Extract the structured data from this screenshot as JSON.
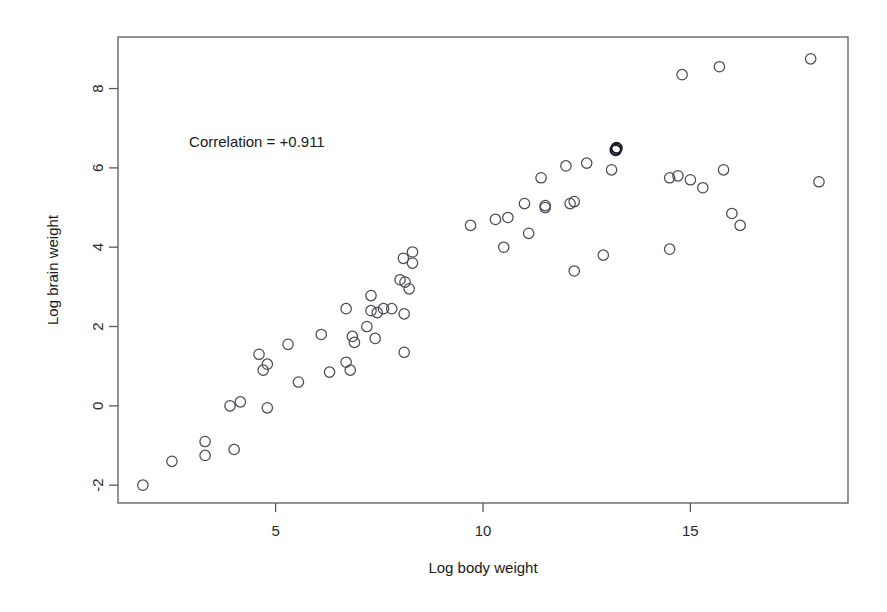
{
  "chart_data": {
    "type": "scatter",
    "title": "",
    "xlabel": "Log body weight",
    "ylabel": "Log brain weight",
    "xlim": [
      1.2,
      18.8
    ],
    "ylim": [
      -2.45,
      9.3
    ],
    "xticks": [
      5,
      10,
      15
    ],
    "yticks": [
      -2,
      0,
      2,
      4,
      6,
      8
    ],
    "xtick_labels": [
      "5",
      "10",
      "15"
    ],
    "ytick_labels": [
      "-2",
      "0",
      "2",
      "4",
      "6",
      "8"
    ],
    "grid": false,
    "legend": null,
    "marker": "open-circle",
    "annotations": [
      {
        "text": "Correlation = +0.911",
        "x": 4.55,
        "y": 6.52
      }
    ],
    "correlation": "+0.911",
    "n_points": 66,
    "points": [
      {
        "x": 1.8,
        "y": -2.0
      },
      {
        "x": 2.5,
        "y": -1.4
      },
      {
        "x": 3.3,
        "y": -0.9
      },
      {
        "x": 3.3,
        "y": -1.25
      },
      {
        "x": 4.0,
        "y": -1.1
      },
      {
        "x": 3.9,
        "y": 0.0
      },
      {
        "x": 4.15,
        "y": 0.1
      },
      {
        "x": 4.6,
        "y": 1.3
      },
      {
        "x": 4.8,
        "y": 1.05
      },
      {
        "x": 4.7,
        "y": 0.9
      },
      {
        "x": 4.8,
        "y": -0.05
      },
      {
        "x": 5.3,
        "y": 1.55
      },
      {
        "x": 5.55,
        "y": 0.6
      },
      {
        "x": 6.1,
        "y": 1.8
      },
      {
        "x": 6.3,
        "y": 0.85
      },
      {
        "x": 6.7,
        "y": 2.45
      },
      {
        "x": 6.7,
        "y": 1.1
      },
      {
        "x": 6.85,
        "y": 1.75
      },
      {
        "x": 6.9,
        "y": 1.6
      },
      {
        "x": 6.8,
        "y": 0.9
      },
      {
        "x": 7.2,
        "y": 2.0
      },
      {
        "x": 7.3,
        "y": 2.78
      },
      {
        "x": 7.3,
        "y": 2.4
      },
      {
        "x": 7.45,
        "y": 2.35
      },
      {
        "x": 7.6,
        "y": 2.45
      },
      {
        "x": 7.8,
        "y": 2.45
      },
      {
        "x": 7.4,
        "y": 1.7
      },
      {
        "x": 8.1,
        "y": 2.32
      },
      {
        "x": 8.3,
        "y": 3.88
      },
      {
        "x": 8.08,
        "y": 3.72
      },
      {
        "x": 8.3,
        "y": 3.6
      },
      {
        "x": 8.0,
        "y": 3.18
      },
      {
        "x": 8.12,
        "y": 3.12
      },
      {
        "x": 8.22,
        "y": 2.95
      },
      {
        "x": 8.1,
        "y": 1.35
      },
      {
        "x": 9.7,
        "y": 4.55
      },
      {
        "x": 10.3,
        "y": 4.7
      },
      {
        "x": 10.6,
        "y": 4.75
      },
      {
        "x": 10.5,
        "y": 4.0
      },
      {
        "x": 11.0,
        "y": 5.1
      },
      {
        "x": 11.1,
        "y": 4.35
      },
      {
        "x": 11.5,
        "y": 5.0
      },
      {
        "x": 11.4,
        "y": 5.75
      },
      {
        "x": 11.5,
        "y": 5.05
      },
      {
        "x": 12.0,
        "y": 6.05
      },
      {
        "x": 12.1,
        "y": 5.1
      },
      {
        "x": 12.2,
        "y": 5.15
      },
      {
        "x": 12.2,
        "y": 3.4
      },
      {
        "x": 12.5,
        "y": 6.12
      },
      {
        "x": 13.1,
        "y": 5.95
      },
      {
        "x": 13.2,
        "y": 6.45
      },
      {
        "x": 13.22,
        "y": 6.5
      },
      {
        "x": 12.9,
        "y": 3.8
      },
      {
        "x": 14.5,
        "y": 3.95
      },
      {
        "x": 14.5,
        "y": 5.75
      },
      {
        "x": 14.7,
        "y": 5.8
      },
      {
        "x": 15.0,
        "y": 5.7
      },
      {
        "x": 15.3,
        "y": 5.5
      },
      {
        "x": 15.8,
        "y": 5.95
      },
      {
        "x": 16.0,
        "y": 4.85
      },
      {
        "x": 16.2,
        "y": 4.55
      },
      {
        "x": 14.8,
        "y": 8.35
      },
      {
        "x": 15.7,
        "y": 8.55
      },
      {
        "x": 17.9,
        "y": 8.75
      },
      {
        "x": 18.1,
        "y": 5.65
      }
    ],
    "emphasized_points": [
      {
        "x": 13.2,
        "y": 6.45
      },
      {
        "x": 13.22,
        "y": 6.5
      }
    ]
  },
  "figure": {
    "background_color": "#ffffff",
    "frame_color": "#5a5a5a",
    "marker_color": "#4a4a58",
    "text_color": "#1a1a1a"
  }
}
